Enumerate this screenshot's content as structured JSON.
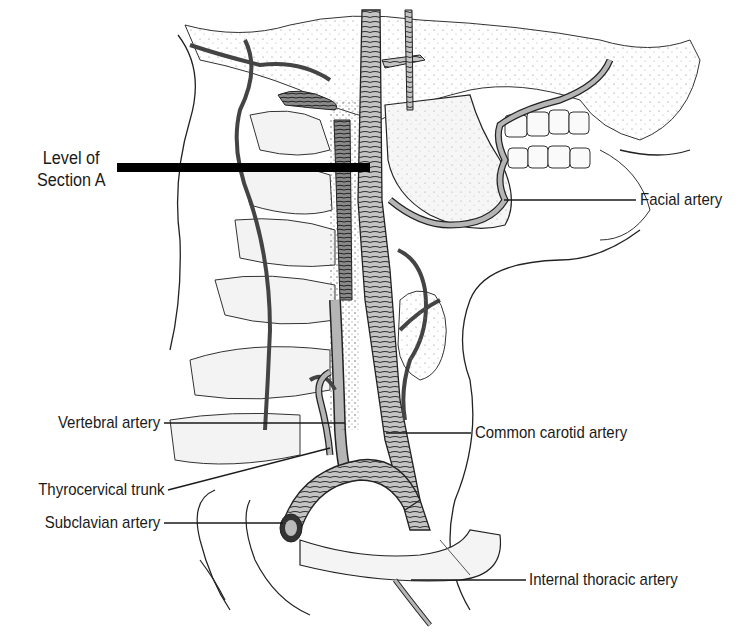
{
  "figure": {
    "section_marker": {
      "line1": "Level of",
      "line2": "Section A"
    },
    "labels": [
      {
        "id": "facial",
        "text": "Facial artery",
        "side": "right"
      },
      {
        "id": "vertebral",
        "text": "Vertebral artery",
        "side": "left"
      },
      {
        "id": "common-carotid",
        "text": "Common carotid artery",
        "side": "right"
      },
      {
        "id": "thyrocervical",
        "text": "Thyrocervical trunk",
        "side": "left"
      },
      {
        "id": "subclavian",
        "text": "Subclavian artery",
        "side": "left"
      },
      {
        "id": "internal-thoracic",
        "text": "Internal thoracic artery",
        "side": "right"
      }
    ],
    "colors": {
      "background": "#ffffff",
      "ink": "#1a1a1a",
      "artery_fill": "#b9b9b9",
      "vein_fill": "#6e6e6e",
      "bone_fill": "#f2f2f2"
    }
  }
}
